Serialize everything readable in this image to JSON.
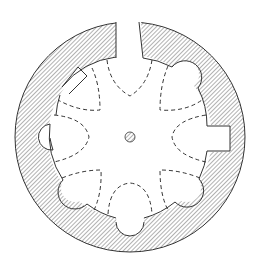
{
  "figure": {
    "title": "",
    "colors": {
      "background": "#ffffff",
      "line": "#333333",
      "hatch": "#555555"
    },
    "elements": {
      "outer_wall": "hatched-ring",
      "entrance": "gap-top",
      "niches": [
        "upper-left-rectangular",
        "upper-right-semicircular",
        "left-semicircular",
        "right-rectangular",
        "lower-left-semicircular",
        "bottom-semicircular",
        "lower-right-semicircular"
      ],
      "central_post": "small hatched circle",
      "vault_lines": "eight dashed lobes"
    }
  }
}
